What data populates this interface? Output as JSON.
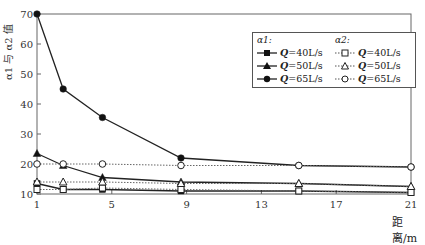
{
  "chart_data": {
    "type": "line",
    "title": "",
    "xlabel": "距离/m",
    "ylabel": "α1 与 α2 值",
    "xlim": [
      1,
      21
    ],
    "ylim": [
      10,
      70
    ],
    "xticks": [
      1,
      5,
      9,
      13,
      17,
      21
    ],
    "yticks": [
      10,
      20,
      30,
      40,
      50,
      60,
      70
    ],
    "grid": false,
    "legend_position": "upper right",
    "x": [
      1,
      2.4,
      4.5,
      8.7,
      15,
      21
    ],
    "series": [
      {
        "name": "α1: Q=40L/s",
        "group": "α1",
        "marker": "filled-square",
        "line": "solid",
        "values": [
          13.5,
          11.5,
          11.5,
          11,
          11,
          10.5
        ]
      },
      {
        "name": "α1: Q=50L/s",
        "group": "α1",
        "marker": "filled-triangle",
        "line": "solid",
        "values": [
          23.5,
          19.5,
          15.5,
          14,
          13.5,
          12.5
        ]
      },
      {
        "name": "α1: Q=65L/s",
        "group": "α1",
        "marker": "filled-circle",
        "line": "solid",
        "values": [
          70,
          45,
          35.5,
          22,
          19.5,
          19
        ]
      },
      {
        "name": "α2: Q=40L/s",
        "group": "α2",
        "marker": "open-square",
        "line": "dotted",
        "values": [
          11.5,
          11.5,
          12,
          11.5,
          11,
          10.5
        ]
      },
      {
        "name": "α2: Q=50L/s",
        "group": "α2",
        "marker": "open-triangle",
        "line": "dotted",
        "values": [
          14,
          14,
          14,
          13.5,
          13.5,
          12.5
        ]
      },
      {
        "name": "α2: Q=65L/s",
        "group": "α2",
        "marker": "open-circle",
        "line": "dotted",
        "values": [
          20,
          20,
          20,
          19.5,
          19.5,
          19
        ]
      }
    ]
  },
  "legend": {
    "group1_title": "α1:",
    "group2_title": "α2:",
    "q40": "Q",
    "q40_val": "=40L/s",
    "q50": "Q",
    "q50_val": "=50L/s",
    "q65": "Q",
    "q65_val": "=65L/s"
  },
  "axes": {
    "xlabel": "距离/m",
    "ylabel": "α1 与 α2 值"
  }
}
